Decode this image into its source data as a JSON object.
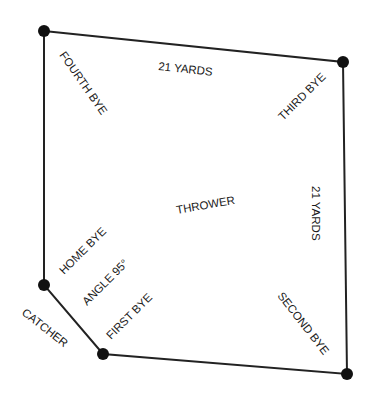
{
  "diagram": {
    "colors": {
      "line": "#222222",
      "node": "#111111",
      "text": "#1a1a1a"
    },
    "labels": {
      "top_side": "21 YARDS",
      "right_side": "21 YARDS",
      "center": "THROWER",
      "fourth_bye": "FOURTH BYE",
      "third_bye": "THIRD BYE",
      "second_bye": "SECOND BYE",
      "first_bye": "FIRST BYE",
      "home_bye": "HOME BYE",
      "angle": "ANGLE 95°",
      "catcher": "CATCHER"
    }
  }
}
